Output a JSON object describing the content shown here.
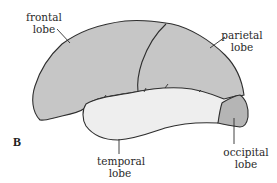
{
  "figure": {
    "panel_label": "B",
    "colors": {
      "frontal_parietal_fill": "#c6c6c6",
      "temporal_fill": "#eeeeee",
      "occipital_fill": "#b5b5b5",
      "outline": "#2e2e2e"
    },
    "labels": {
      "frontal": [
        "frontal",
        "lobe"
      ],
      "parietal": [
        "parietal",
        "lobe"
      ],
      "temporal": [
        "temporal",
        "lobe"
      ],
      "occipital": [
        "occipital",
        "lobe"
      ]
    }
  }
}
